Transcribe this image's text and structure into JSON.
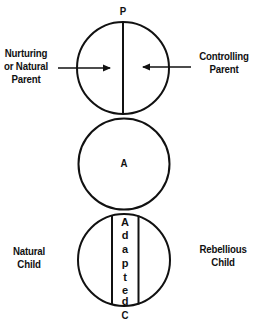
{
  "diagram": {
    "type": "ego-state structural diagram",
    "colors": {
      "stroke": "#111111",
      "background": "#ffffff"
    },
    "parent": {
      "circle_label": "P",
      "left_label": [
        "Nurturing",
        "or Natural",
        "Parent"
      ],
      "right_label": [
        "Controlling",
        "Parent"
      ]
    },
    "adult": {
      "circle_label": "A"
    },
    "child": {
      "circle_label": "C",
      "center_label": "Adapted",
      "center_letters": [
        "A",
        "d",
        "a",
        "p",
        "t",
        "e",
        "d"
      ],
      "left_label": [
        "Natural",
        "Child"
      ],
      "right_label": [
        "Rebellious",
        "Child"
      ]
    }
  }
}
